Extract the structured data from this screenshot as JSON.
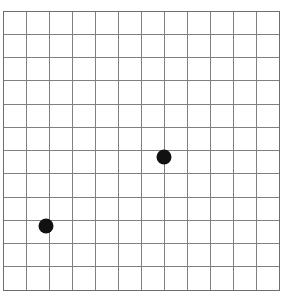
{
  "figure": {
    "title": "",
    "background_color": "#ffffff",
    "width": 285,
    "height": 306
  },
  "grid": {
    "name": "square-grid",
    "line_color": "#808080",
    "line_width": 1,
    "border_color": "#6e6e6e",
    "border_width": 1,
    "origin_x": 3,
    "origin_y": 11,
    "cell_width": 23,
    "cell_height": 23.25,
    "columns": 12,
    "rows": 12,
    "right_edge": 279,
    "bottom_edge": 290
  },
  "chart_data": {
    "type": "scatter",
    "title": "",
    "xlabel": "",
    "ylabel": "",
    "grid": true,
    "legend": false,
    "xlim": [
      0,
      12
    ],
    "ylim": [
      0,
      12
    ],
    "xticks": [
      0,
      1,
      2,
      3,
      4,
      5,
      6,
      7,
      8,
      9,
      10,
      11,
      12
    ],
    "yticks": [
      0,
      1,
      2,
      3,
      4,
      5,
      6,
      7,
      8,
      9,
      10,
      11,
      12
    ],
    "xticklabels": [],
    "yticklabels": [],
    "marker": "circle",
    "marker_color": "#111111",
    "marker_diameter_px": 15,
    "points": [
      {
        "label": "upper-right-point",
        "grid_col": 7,
        "grid_row": 6,
        "x": 7,
        "y": 6,
        "px": 164,
        "py": 157
      },
      {
        "label": "lower-left-point",
        "grid_col": 2,
        "grid_row": 9,
        "x": 2,
        "y": 3,
        "px": 46,
        "py": 226
      }
    ]
  }
}
